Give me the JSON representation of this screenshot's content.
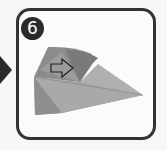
{
  "diagram": {
    "type": "origami-step",
    "step_number": "6",
    "pointer_icon": "triangle-right",
    "action_arrow": "hollow-right-arrow",
    "colors": {
      "frame_border": "#333333",
      "badge_bg": "#2b2b2b",
      "badge_text": "#ffffff",
      "paper_light": "#a8a8a8",
      "paper_mid": "#959595",
      "paper_dark": "#7a7a7a",
      "background": "#fbfbfa"
    }
  }
}
